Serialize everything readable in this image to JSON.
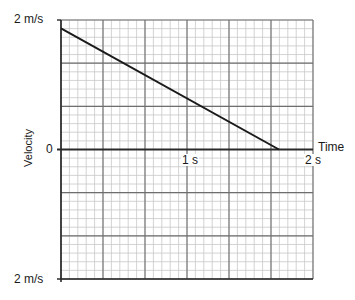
{
  "chart_data": {
    "type": "line",
    "title": "",
    "xlabel": "Time",
    "ylabel": "Velocity",
    "x_unit": "s",
    "y_unit": "m/s",
    "xlim": [
      0,
      2
    ],
    "ylim": [
      -2,
      2
    ],
    "x_tick_labels": [
      "1 s",
      "2 s"
    ],
    "y_tick_labels": [
      "2 m/s",
      "0",
      "2 m/s"
    ],
    "grid": true,
    "grid_major_x_step": 0.3333,
    "grid_major_y_step": 0.6667,
    "grid_minor_subdivisions": 5,
    "series": [
      {
        "name": "velocity",
        "color": "#1a1a1a",
        "x": [
          0,
          1.73
        ],
        "y": [
          1.87,
          0
        ]
      }
    ]
  },
  "labels": {
    "y_top": "2 m/s",
    "y_zero": "0",
    "y_bottom": "2 m/s",
    "y_axis_title": "Velocity",
    "x_one": "1 s",
    "x_two": "2 s",
    "x_axis_title": "Time"
  },
  "colors": {
    "minor_grid": "#c8c8c8",
    "major_grid": "#6e6e6e",
    "axis": "#2a2a2a",
    "line": "#1a1a1a"
  }
}
